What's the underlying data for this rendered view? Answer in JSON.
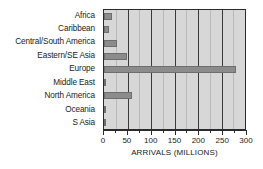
{
  "chart_data": {
    "type": "bar",
    "orientation": "horizontal",
    "title": "",
    "xlabel": "ARRIVALS (MILLIONS)",
    "ylabel": "",
    "categories": [
      "Africa",
      "Caribbean",
      "Central/South America",
      "Eastern/SE Asia",
      "Europe",
      "Middle East",
      "North America",
      "Oceania",
      "S Asia"
    ],
    "values": [
      17,
      10,
      28,
      48,
      280,
      5,
      60,
      4,
      2
    ],
    "xlim": [
      0,
      300
    ],
    "xticks": [
      0,
      50,
      100,
      150,
      200,
      250,
      300
    ],
    "xtick_labels": [
      "0",
      "50",
      "100",
      "150",
      "200",
      "250",
      "300"
    ],
    "xminorticks": [
      25,
      75,
      125,
      175,
      225,
      275
    ],
    "grid": true,
    "legend": null,
    "colors": {
      "bar": "#8c8c8c",
      "bar_edge": "#6e6e6e",
      "plot_background": "#d7d7d7",
      "axis": "#2b2b2b",
      "gridline": "#3a3a3a",
      "text": "#1a1a1a",
      "page_background": "#ffffff"
    }
  }
}
